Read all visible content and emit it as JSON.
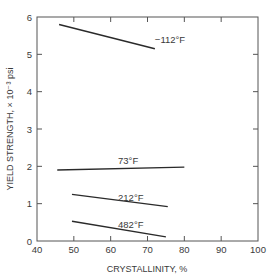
{
  "chart_data": {
    "type": "line",
    "title": "",
    "xlabel": "CRYSTALLINITY, %",
    "ylabel": "YIELD STRENGTH, × 10⁻³ psi",
    "xlim": [
      40,
      100
    ],
    "ylim": [
      0,
      6
    ],
    "x_ticks": [
      40,
      50,
      60,
      70,
      80,
      90,
      100
    ],
    "y_ticks": [
      0,
      1,
      2,
      3,
      4,
      5,
      6
    ],
    "grid": false,
    "legend": "inline labels",
    "series": [
      {
        "name": "−112°F",
        "x": [
          46,
          72
        ],
        "y": [
          5.8,
          5.15
        ],
        "label_pos": [
          72,
          5.3
        ]
      },
      {
        "name": "73°F",
        "x": [
          45.5,
          80
        ],
        "y": [
          1.9,
          1.98
        ],
        "label_pos": [
          62,
          2.07
        ]
      },
      {
        "name": "212°F",
        "x": [
          49.5,
          75.5
        ],
        "y": [
          1.25,
          0.92
        ],
        "label_pos": [
          62,
          1.08
        ]
      },
      {
        "name": "482°F",
        "x": [
          49.5,
          75
        ],
        "y": [
          0.53,
          0.11
        ],
        "label_pos": [
          62,
          0.36
        ]
      }
    ]
  },
  "colors": {
    "line": "#2a2a2a",
    "axis": "#555555",
    "text": "#3a3a3a"
  }
}
